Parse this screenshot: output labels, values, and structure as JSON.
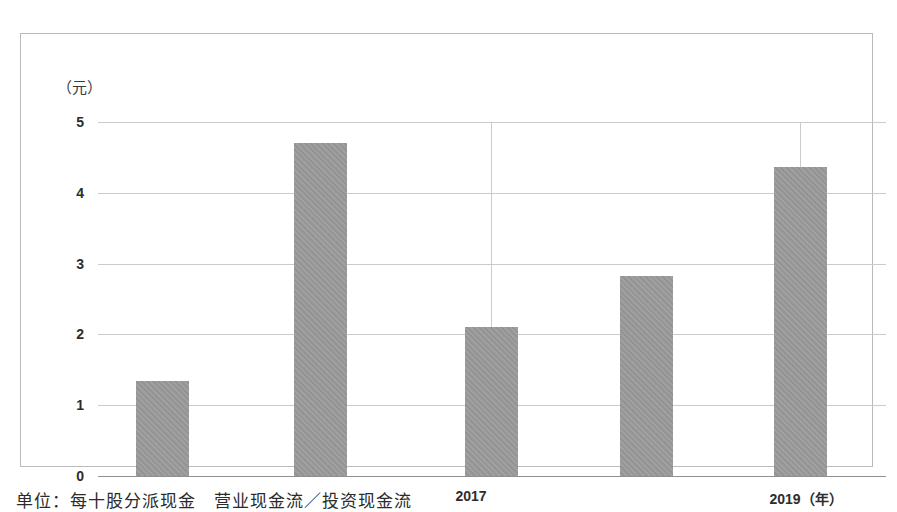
{
  "figure": {
    "y_unit_label": "（元）",
    "caption": "单位：每十股分派现金　营业现金流／投资现金流"
  },
  "chart_data": {
    "type": "bar",
    "title": "",
    "subtitle": "",
    "xlabel": "（年）",
    "ylabel": "（元）",
    "categories": [
      "",
      "",
      "2017",
      "",
      "2019"
    ],
    "values": [
      1.34,
      4.7,
      2.1,
      2.82,
      4.37
    ],
    "series": [
      {
        "name": "每股派现金额",
        "values": [
          1.34,
          4.7,
          2.1,
          2.82,
          4.37
        ]
      }
    ],
    "ylim": [
      0,
      5
    ],
    "ytick_labels": [
      "0",
      "1",
      "2",
      "3",
      "4",
      "5"
    ],
    "ytick_values": [
      0,
      1,
      2,
      3,
      4,
      5
    ],
    "xtick_labels": [
      "2017",
      "2019（年）"
    ],
    "xtick_indices": [
      2,
      4
    ],
    "grid": true,
    "grid_horizontal": true,
    "grid_vertical_at": [
      2,
      4
    ],
    "legend": "none",
    "bar_color": "#9a9a9a",
    "grid_color": "#c9cbcd",
    "axis_color": "#8d8f91",
    "frame_color": "#b9bbbd",
    "background": "#ffffff",
    "bar_width_px": 53,
    "bar_centers_px": [
      141,
      299,
      470,
      625,
      779
    ]
  }
}
